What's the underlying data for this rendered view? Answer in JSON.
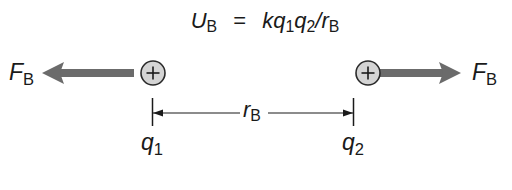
{
  "equation": {
    "lhs_symbol": "U",
    "lhs_subscript": "B",
    "equals": "=",
    "rhs_k": "k",
    "rhs_q1": "q",
    "rhs_q1_sub": "1",
    "rhs_q2": "q",
    "rhs_q2_sub": "2",
    "rhs_slash": "/",
    "rhs_r": "r",
    "rhs_r_sub": "B"
  },
  "charges": [
    {
      "id": "q1",
      "symbol": "q",
      "subscript": "1",
      "sign": "+",
      "center_x": 153,
      "center_y": 73
    },
    {
      "id": "q2",
      "symbol": "q",
      "subscript": "2",
      "sign": "+",
      "center_x": 368,
      "center_y": 73
    }
  ],
  "forces": [
    {
      "symbol": "F",
      "subscript": "B",
      "direction": "left"
    },
    {
      "symbol": "F",
      "subscript": "B",
      "direction": "right"
    }
  ],
  "separation": {
    "symbol": "r",
    "subscript": "B"
  },
  "colors": {
    "charge_fill": "#d4d4d4",
    "charge_stroke": "#2a2a2a",
    "force_arrow": "#6b6b6b",
    "line": "#1a1a1a",
    "text": "#1a1a1a"
  }
}
